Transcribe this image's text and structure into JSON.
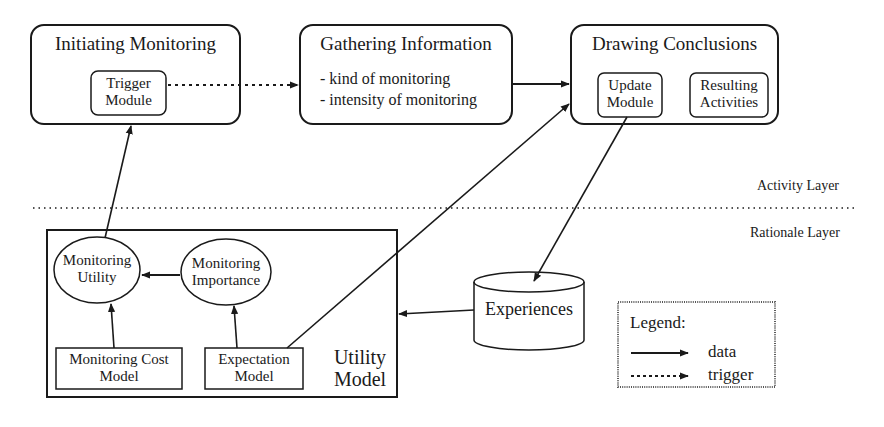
{
  "activity_layer": {
    "label": "Activity Layer",
    "boxes": [
      {
        "id": "initiating",
        "title": "Initiating Monitoring",
        "modules": [
          {
            "line1": "Trigger",
            "line2": "Module"
          }
        ]
      },
      {
        "id": "gathering",
        "title": "Gathering Information",
        "bullets": [
          "- kind of monitoring",
          "- intensity of monitoring"
        ]
      },
      {
        "id": "drawing",
        "title": "Drawing Conclusions",
        "modules": [
          {
            "line1": "Update",
            "line2": "Module"
          },
          {
            "line1": "Resulting",
            "line2": "Activities"
          }
        ]
      }
    ]
  },
  "rationale_layer": {
    "label": "Rationale Layer",
    "utility_model": {
      "label_line1": "Utility",
      "label_line2": "Model",
      "ellipses": [
        {
          "line1": "Monitoring",
          "line2": "Utility"
        },
        {
          "line1": "Monitoring",
          "line2": "Importance"
        }
      ],
      "models": [
        {
          "line1": "Monitoring Cost",
          "line2": "Model"
        },
        {
          "line1": "Expectation",
          "line2": "Model"
        }
      ]
    },
    "store": {
      "label": "Experiences"
    }
  },
  "legend": {
    "title": "Legend:",
    "items": [
      {
        "style": "solid",
        "label": "data"
      },
      {
        "style": "dotted",
        "label": "trigger"
      }
    ]
  },
  "edges": [
    {
      "from": "Trigger Module",
      "to": "Gathering Information",
      "type": "trigger"
    },
    {
      "from": "Gathering Information",
      "to": "Drawing Conclusions",
      "type": "data"
    },
    {
      "from": "Expectation Model",
      "to": "Drawing Conclusions",
      "type": "data"
    },
    {
      "from": "Update Module",
      "to": "Experiences",
      "type": "data"
    },
    {
      "from": "Experiences",
      "to": "Utility Model",
      "type": "data"
    },
    {
      "from": "Monitoring Utility",
      "to": "Trigger Module",
      "type": "data"
    },
    {
      "from": "Monitoring Importance",
      "to": "Monitoring Utility",
      "type": "data"
    },
    {
      "from": "Monitoring Cost Model",
      "to": "Monitoring Utility",
      "type": "data"
    },
    {
      "from": "Expectation Model",
      "to": "Monitoring Importance",
      "type": "data"
    }
  ]
}
